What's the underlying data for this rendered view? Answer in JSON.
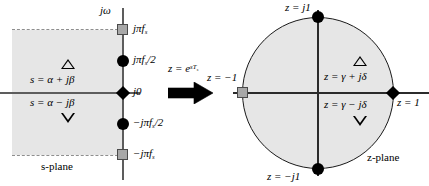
{
  "figure": {
    "type": "diagram",
    "left_panel_name": "s-plane",
    "right_panel_name": "z-plane"
  },
  "s_plane": {
    "caption": "s-plane",
    "vertical_axis_label": "jω",
    "axis_point_labels": [
      {
        "id": "jpifs",
        "text": "jπf",
        "subscript": "s",
        "suffix": "",
        "marker": "square",
        "y": 30
      },
      {
        "id": "jpifs2",
        "text": "jπf",
        "subscript": "s",
        "suffix": "/2",
        "marker": "circle",
        "y": 61
      },
      {
        "id": "j0",
        "text": "j0",
        "subscript": "",
        "suffix": "",
        "marker": "diamond",
        "y": 93
      },
      {
        "id": "negjpifs2",
        "text": "−jπf",
        "subscript": "s",
        "suffix": "/2",
        "marker": "circle",
        "y": 124
      },
      {
        "id": "negjpifs",
        "text": "−jπf",
        "subscript": "s",
        "suffix": "",
        "marker": "square",
        "y": 155
      }
    ],
    "upper_point_label": "s = α + jβ",
    "lower_point_label": "s = α − jβ",
    "upper_marker_glyph": "triangle-up",
    "lower_marker_glyph": "triangle-down",
    "shaded_region_note": "left half-plane strip (shaded)"
  },
  "transform": {
    "label": "z = e",
    "exponent": "sT",
    "exponent_sub": "s",
    "arrow_glyph": "right-arrow"
  },
  "z_plane": {
    "caption": "z-plane",
    "unit_circle_labels": [
      {
        "id": "zj1",
        "text": "z = j1",
        "marker": "circle",
        "position": "top"
      },
      {
        "id": "zneg1",
        "text": "z = −1",
        "marker": "square",
        "position": "left"
      },
      {
        "id": "zpos1",
        "text": "z = 1",
        "marker": "diamond",
        "position": "right"
      },
      {
        "id": "znegj1",
        "text": "z = −j1",
        "marker": "circle",
        "position": "bottom"
      }
    ],
    "upper_point_label": "z = γ + jδ",
    "lower_point_label": "z = γ − jδ",
    "upper_marker_glyph": "triangle-up",
    "lower_marker_glyph": "triangle-down"
  },
  "colors": {
    "shade": "#e6e6e6",
    "axis": "#5d5d5d",
    "marker_black": "#000000",
    "marker_gray": "#a8a8a8",
    "outline": "#1a1a1a"
  }
}
